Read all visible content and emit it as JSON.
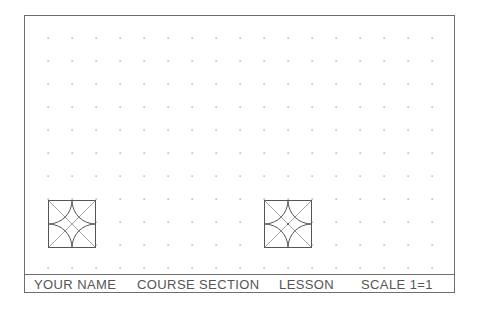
{
  "drawing": {
    "type": "cad-drawing-sheet",
    "border_color": "#6e6e6e",
    "dot_color": "#888888",
    "grid": {
      "x_start": 48,
      "x_step": 24,
      "columns": 17,
      "y_start": 38,
      "y_step": 23,
      "rows": 11
    }
  },
  "title_block": {
    "your_name": "YOUR NAME",
    "course_section": "COURSE SECTION",
    "lesson": "LESSON",
    "scale": "SCALE 1=1"
  },
  "shapes": [
    {
      "name": "star-pattern-square-1",
      "x": 48,
      "y": 200,
      "size": 47,
      "center_dot": false
    },
    {
      "name": "star-pattern-square-2",
      "x": 264,
      "y": 200,
      "size": 47,
      "center_dot": true
    }
  ]
}
